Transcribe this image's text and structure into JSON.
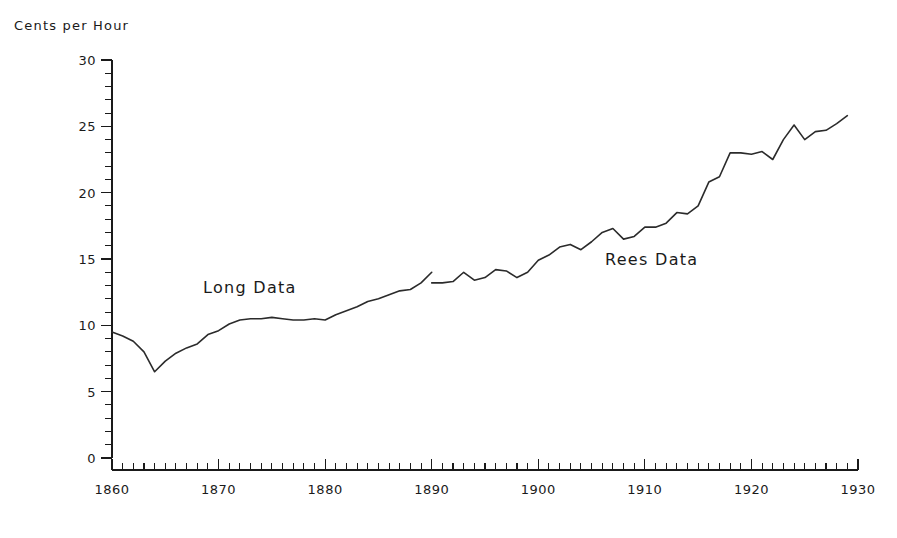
{
  "chart_data": {
    "type": "line",
    "title": "",
    "subtitle": "",
    "ylabel": "Cents per Hour",
    "xlabel": "",
    "xlim": [
      1860,
      1930
    ],
    "ylim": [
      0,
      30
    ],
    "grid": false,
    "legend_position": "inline-annotation",
    "x_major_ticks": [
      1860,
      1870,
      1880,
      1890,
      1900,
      1910,
      1920,
      1930
    ],
    "x_major_tick_labels": [
      "1860",
      "1870",
      "1880",
      "1890",
      "1900",
      "1910",
      "1920",
      "1930"
    ],
    "x_minor_tick_step": 1,
    "y_major_ticks": [
      0,
      5,
      10,
      15,
      20,
      25,
      30
    ],
    "y_major_tick_labels": [
      "0",
      "5",
      "10",
      "15",
      "20",
      "25",
      "30"
    ],
    "y_minor_tick_step": 1,
    "annotations": [
      {
        "text": "Long Data",
        "x": 1873.5,
        "y": 12.4
      },
      {
        "text": "Rees Data",
        "x": 1905.0,
        "y": 14.6
      }
    ],
    "series": [
      {
        "name": "Long Data",
        "color": "#2b2b2b",
        "x": [
          1860,
          1861,
          1862,
          1863,
          1864,
          1865,
          1866,
          1867,
          1868,
          1869,
          1870,
          1871,
          1872,
          1873,
          1874,
          1875,
          1876,
          1877,
          1878,
          1879,
          1880,
          1881,
          1882,
          1883,
          1884,
          1885,
          1886,
          1887,
          1888,
          1889,
          1890
        ],
        "values": [
          9.5,
          9.2,
          8.8,
          8.0,
          6.5,
          7.3,
          7.9,
          8.3,
          8.6,
          9.3,
          9.6,
          10.1,
          10.4,
          10.5,
          10.5,
          10.6,
          10.5,
          10.4,
          10.4,
          10.5,
          10.4,
          10.8,
          11.1,
          11.4,
          11.8,
          12.0,
          12.3,
          12.6,
          12.7,
          13.2,
          14.0
        ]
      },
      {
        "name": "Rees Data",
        "color": "#2b2b2b",
        "x": [
          1890,
          1891,
          1892,
          1893,
          1894,
          1895,
          1896,
          1897,
          1898,
          1899,
          1900,
          1901,
          1902,
          1903,
          1904,
          1905,
          1906,
          1907,
          1908,
          1909,
          1910,
          1911,
          1912,
          1913,
          1914,
          1915,
          1916,
          1917,
          1918,
          1919,
          1920,
          1921,
          1922,
          1923,
          1924,
          1925,
          1926,
          1927,
          1928,
          1929
        ],
        "values": [
          13.2,
          13.2,
          13.3,
          14.0,
          13.4,
          13.6,
          14.2,
          14.1,
          13.6,
          14.0,
          14.9,
          15.3,
          15.9,
          16.1,
          15.7,
          16.3,
          17.0,
          17.3,
          16.5,
          16.7,
          17.4,
          17.4,
          17.7,
          18.5,
          18.4,
          19.0,
          20.8,
          21.2,
          23.0,
          23.0,
          22.9,
          23.1,
          22.5,
          24.0,
          25.1,
          24.0,
          24.6,
          24.7,
          25.2,
          25.8
        ]
      }
    ]
  },
  "axis": {
    "y_title": "Cents per Hour"
  }
}
